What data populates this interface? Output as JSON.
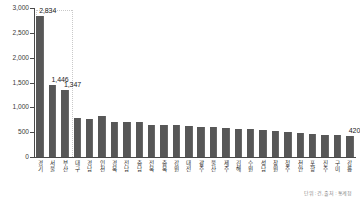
{
  "chart_data": {
    "type": "bar",
    "title": "",
    "subtitle": "",
    "xlabel": "",
    "ylabel": "",
    "ylim": [
      0,
      3000
    ],
    "ytick_labels": [
      "3,000",
      "2,500",
      "2,000",
      "1,500",
      "1,000",
      "500",
      "0"
    ],
    "ytick_values": [
      3000,
      2500,
      2000,
      1500,
      1000,
      500,
      0
    ],
    "grid": false,
    "legend": "none",
    "orientation": "vertical",
    "bar_color": "#575757",
    "axis_color": "#4a4a4a",
    "guide_color": "#c9c9c9",
    "categories": [
      "경기",
      "서울",
      "부산",
      "대구",
      "경남",
      "인천",
      "경북",
      "전남",
      "충남",
      "전북",
      "충북",
      "강원",
      "대전",
      "광주",
      "울산",
      "제주",
      "김해",
      "수원",
      "성남",
      "창원",
      "청주",
      "천안",
      "포항",
      "진주",
      "구미",
      "강릉"
    ],
    "values": [
      2834,
      1446,
      1347,
      790,
      772,
      820,
      712,
      700,
      702,
      640,
      638,
      636,
      624,
      612,
      600,
      592,
      564,
      556,
      552,
      520,
      506,
      478,
      462,
      452,
      434,
      420
    ],
    "labeled_points": [
      {
        "index": 0,
        "label": "2,834"
      },
      {
        "index": 1,
        "label": "1,446"
      },
      {
        "index": 2,
        "label": "1,347"
      },
      {
        "index": 25,
        "label": "420"
      }
    ],
    "annotations": []
  },
  "footer": {
    "source_note": "단위 : 건, 출처 : 통계청"
  }
}
